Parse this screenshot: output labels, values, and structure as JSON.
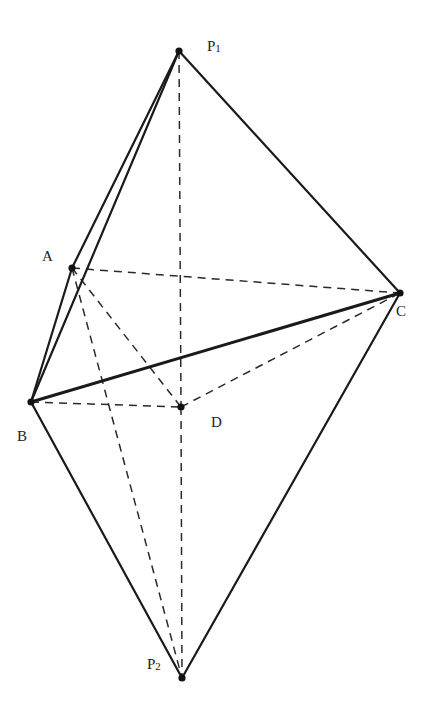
{
  "figure": {
    "type": "geometric-diagram"
  },
  "vertices": {
    "P1": {
      "label": "P",
      "sub": "1",
      "x": 179,
      "y": 51,
      "label_x": 207,
      "label_y": 51
    },
    "A": {
      "label": "A",
      "sub": "",
      "x": 72,
      "y": 268,
      "label_x": 42,
      "label_y": 261
    },
    "B": {
      "label": "B",
      "sub": "",
      "x": 31,
      "y": 402,
      "label_x": 17,
      "label_y": 441
    },
    "C": {
      "label": "C",
      "sub": "",
      "x": 400,
      "y": 293,
      "label_x": 396,
      "label_y": 316
    },
    "D": {
      "label": "D",
      "sub": "",
      "x": 181,
      "y": 407,
      "label_x": 211,
      "label_y": 427
    },
    "P2": {
      "label": "P",
      "sub": "2",
      "x": 182,
      "y": 678,
      "label_x": 147,
      "label_y": 669
    }
  },
  "edges": {
    "solid": [
      [
        "P1",
        "A"
      ],
      [
        "P1",
        "B"
      ],
      [
        "P1",
        "C"
      ],
      [
        "A",
        "B"
      ],
      [
        "B",
        "C"
      ],
      [
        "B",
        "P2"
      ],
      [
        "C",
        "P2"
      ]
    ],
    "thick": [
      [
        "B",
        "C"
      ]
    ],
    "dashed": [
      [
        "P1",
        "D"
      ],
      [
        "D",
        "P2"
      ],
      [
        "A",
        "C"
      ],
      [
        "A",
        "D"
      ],
      [
        "A",
        "P2"
      ],
      [
        "B",
        "D"
      ],
      [
        "D",
        "C"
      ]
    ]
  },
  "labels": {
    "P1": "P1",
    "A": "A",
    "B": "B",
    "C": "C",
    "D": "D",
    "P2": "P2"
  },
  "colors": {
    "line": "#1a1a1a",
    "background": "#ffffff"
  }
}
